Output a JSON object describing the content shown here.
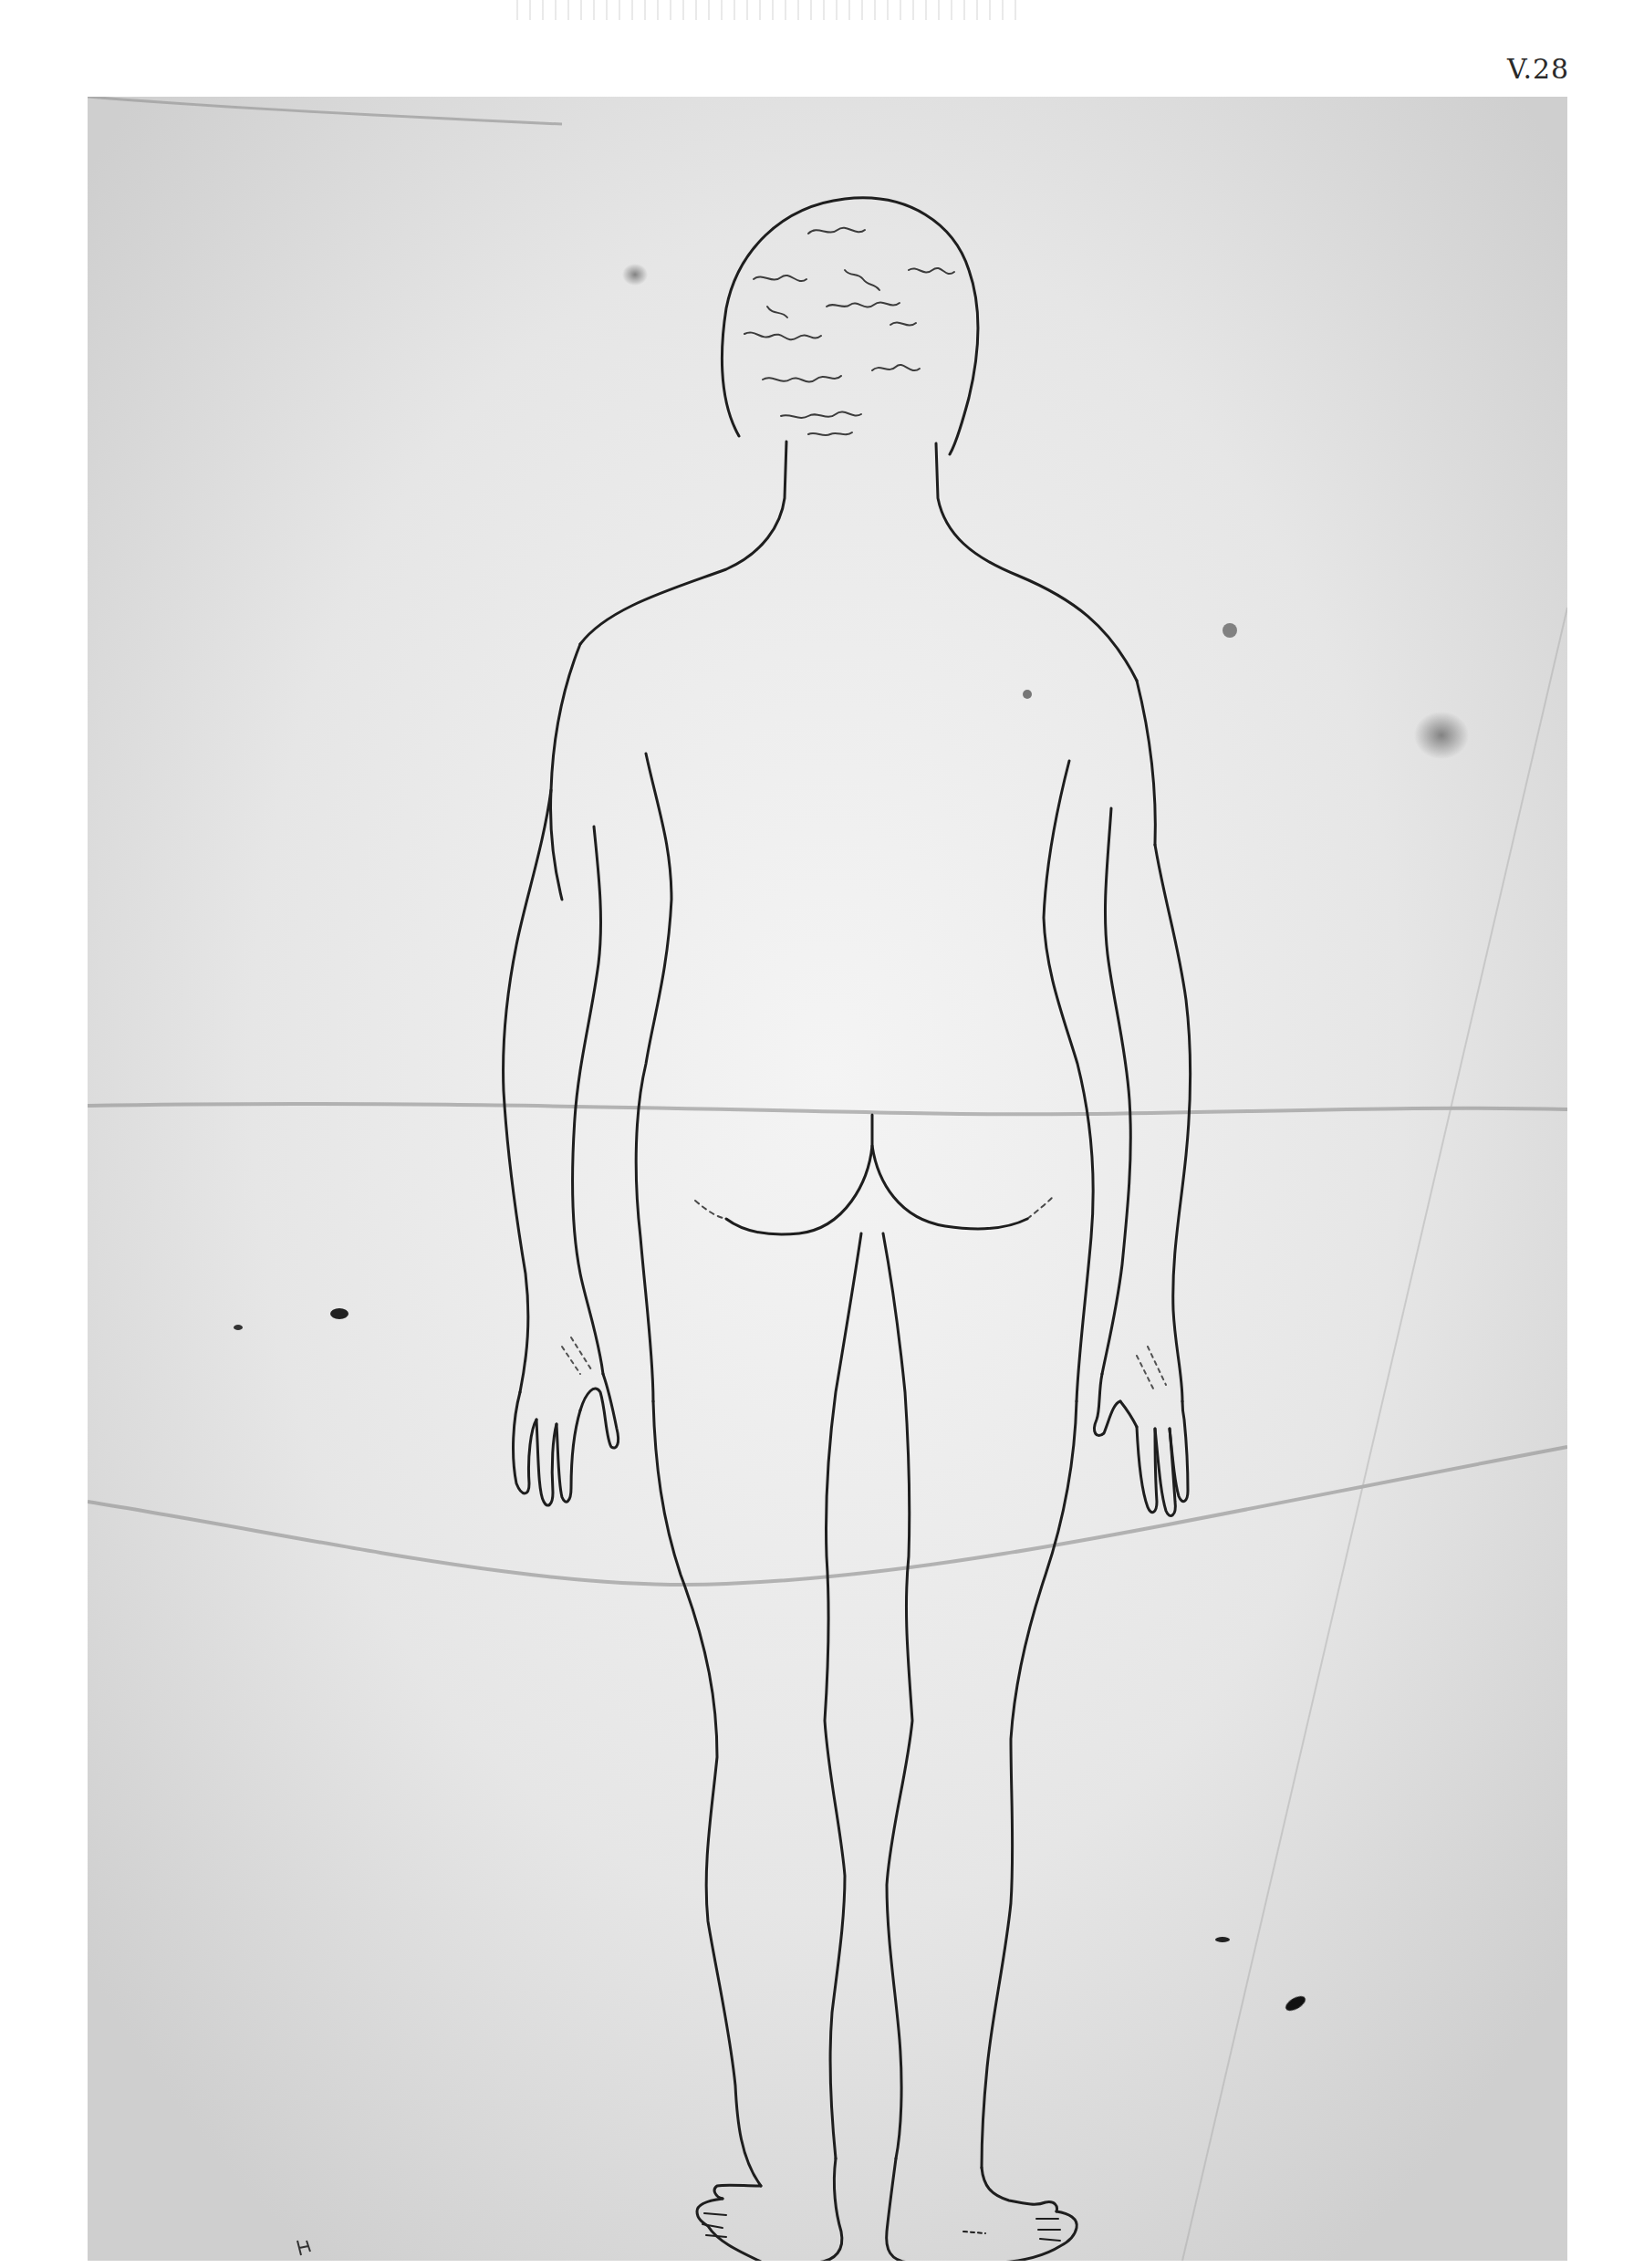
{
  "page": {
    "plate_number": "V.28",
    "background_color": "#ffffff",
    "paper_color": "#dcdcdc",
    "ink_color": "#1e1e1e"
  },
  "drawing": {
    "view": "posterior (back)",
    "elements": [
      "curly hair",
      "neck",
      "shoulders",
      "torso",
      "left arm",
      "right arm",
      "left hand",
      "right hand",
      "buttocks",
      "left leg",
      "right leg",
      "left foot",
      "right foot"
    ],
    "annotations": [
      {
        "text": "ḥ",
        "position": "lower-left margin"
      }
    ]
  },
  "sheet_marks": {
    "creases": [
      "horizontal fold at hip level",
      "curved fold at knee level",
      "diagonal crease right side"
    ],
    "stains": [
      "ink blot left of hand",
      "ink blot lower right",
      "brown stain right margin"
    ]
  }
}
